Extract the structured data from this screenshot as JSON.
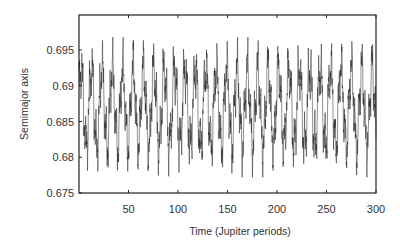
{
  "chart_data": {
    "type": "line",
    "title": "",
    "xlabel": "Time (Jupiter periods)",
    "ylabel": "Semimajor axis",
    "xlim": [
      0,
      300
    ],
    "ylim": [
      0.675,
      0.699
    ],
    "xticks": [
      50,
      100,
      150,
      200,
      250,
      300
    ],
    "xtick_labels": [
      "50",
      "100",
      "150",
      "200",
      "250",
      "300"
    ],
    "yticks": [
      0.675,
      0.68,
      0.685,
      0.69,
      0.695
    ],
    "ytick_labels": [
      "0.675",
      "0.68",
      "0.685",
      "0.69",
      "0.695"
    ],
    "grid": false,
    "legend": null,
    "series": [
      {
        "name": "semimajor axis",
        "color": "#222222",
        "description": "Rapid quasi-periodic oscillation between ~0.6775 and ~0.6965, mean ~0.687, dominant period ~10 Jupiter periods with fast sub-oscillations",
        "model": {
          "mean": 0.687,
          "components": [
            {
              "amp": 0.0055,
              "period": 10.5,
              "phase": 0.3
            },
            {
              "amp": 0.0025,
              "period": 3.4,
              "phase": 1.1
            },
            {
              "amp": 0.0015,
              "period": 1.3,
              "phase": 0.2
            },
            {
              "amp": 0.0012,
              "period": 0.55,
              "phase": 0.7
            }
          ],
          "n_points": 1500
        }
      }
    ]
  }
}
